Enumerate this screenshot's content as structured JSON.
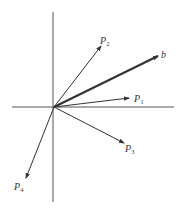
{
  "diagram": {
    "type": "vector-diagram",
    "origin": {
      "x": 54,
      "y": 107
    },
    "axes": {
      "horizontal": {
        "x1": 12,
        "y1": 107,
        "x2": 174,
        "y2": 107,
        "color": "#555555"
      },
      "vertical": {
        "x1": 53,
        "y1": 12,
        "x2": 53,
        "y2": 202,
        "color": "#555555"
      }
    },
    "vectors": [
      {
        "id": "b",
        "name": "b",
        "sub": "",
        "to": {
          "x": 158,
          "y": 56
        },
        "bold": true,
        "label_pos": {
          "x": 161,
          "y": 58
        }
      },
      {
        "id": "P1",
        "name": "P",
        "sub": "1",
        "to": {
          "x": 129,
          "y": 98
        },
        "bold": false,
        "label_pos": {
          "x": 134,
          "y": 102
        }
      },
      {
        "id": "P2",
        "name": "P",
        "sub": "2",
        "to": {
          "x": 101,
          "y": 46
        },
        "bold": false,
        "label_pos": {
          "x": 100,
          "y": 44
        }
      },
      {
        "id": "P3",
        "name": "P",
        "sub": "3",
        "to": {
          "x": 124,
          "y": 143
        },
        "bold": false,
        "label_pos": {
          "x": 125,
          "y": 152
        }
      },
      {
        "id": "P4",
        "name": "P",
        "sub": "4",
        "to": {
          "x": 26,
          "y": 178
        },
        "bold": false,
        "label_pos": {
          "x": 14,
          "y": 190
        }
      }
    ],
    "colors": {
      "line": "#333333",
      "axis": "#555555",
      "background": "#ffffff"
    }
  }
}
